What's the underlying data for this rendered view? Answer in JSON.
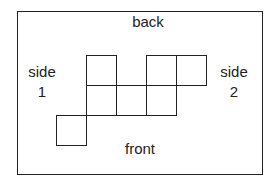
{
  "labels": {
    "back": "back",
    "front": "front",
    "side1_word": "side",
    "side1_num": "1",
    "side2_word": "side",
    "side2_num": "2"
  },
  "net": {
    "description": "Cube net of six unit squares inside a labeled box",
    "square_size": 30,
    "squares": [
      {
        "col": 1,
        "row": 0
      },
      {
        "col": 3,
        "row": 0
      },
      {
        "col": 4,
        "row": 0
      },
      {
        "col": 1,
        "row": 1
      },
      {
        "col": 2,
        "row": 1
      },
      {
        "col": 3,
        "row": 1
      },
      {
        "col": 0,
        "row": 2
      }
    ]
  },
  "colors": {
    "stroke": "#222222",
    "background": "#ffffff"
  }
}
